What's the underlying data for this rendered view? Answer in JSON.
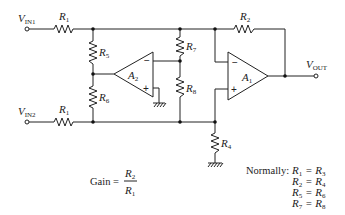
{
  "diagram": {
    "inputs": {
      "vin1": {
        "main": "V",
        "sub": "IN1"
      },
      "vin2": {
        "main": "V",
        "sub": "IN2"
      }
    },
    "output": {
      "main": "V",
      "sub": "OUT"
    },
    "resistors": {
      "r1_top": {
        "main": "R",
        "sub": "1"
      },
      "r1_bottom": {
        "main": "R",
        "sub": "1"
      },
      "r2": {
        "main": "R",
        "sub": "2"
      },
      "r4": {
        "main": "R",
        "sub": "4"
      },
      "r5": {
        "main": "R",
        "sub": "5"
      },
      "r6": {
        "main": "R",
        "sub": "6"
      },
      "r7": {
        "main": "R",
        "sub": "7"
      },
      "r8": {
        "main": "R",
        "sub": "8"
      }
    },
    "opamps": {
      "a1": {
        "main": "A",
        "sub": "1",
        "minus": "−",
        "plus": "+"
      },
      "a2": {
        "main": "A",
        "sub": "2",
        "minus": "−",
        "plus": "+"
      }
    },
    "gain": {
      "label": "Gain =",
      "numerator": {
        "main": "R",
        "sub": "2"
      },
      "denominator": {
        "main": "R",
        "sub": "1"
      }
    },
    "normally": {
      "label": "Normally:",
      "equations": [
        {
          "lhs": {
            "main": "R",
            "sub": "1"
          },
          "eq": "=",
          "rhs": {
            "main": "R",
            "sub": "3"
          }
        },
        {
          "lhs": {
            "main": "R",
            "sub": "2"
          },
          "eq": "=",
          "rhs": {
            "main": "R",
            "sub": "4"
          }
        },
        {
          "lhs": {
            "main": "R",
            "sub": "5"
          },
          "eq": "=",
          "rhs": {
            "main": "R",
            "sub": "6"
          }
        },
        {
          "lhs": {
            "main": "R",
            "sub": "7"
          },
          "eq": "=",
          "rhs": {
            "main": "R",
            "sub": "8"
          }
        }
      ]
    }
  }
}
